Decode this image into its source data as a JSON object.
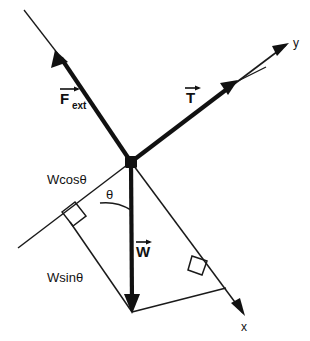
{
  "figure": {
    "background_color": "#ffffff",
    "ink_color": "#111111",
    "width": 310,
    "height": 341
  },
  "origin": {
    "label": "junction-node",
    "x": 131,
    "y": 162
  },
  "axes": [
    {
      "name": "y-axis",
      "label": "y",
      "label_x": 295,
      "label_y": 45,
      "from_x": 131,
      "from_y": 162,
      "to_x": 288,
      "to_y": 43,
      "arrow": "end"
    },
    {
      "name": "x-axis",
      "label": "x",
      "label_x": 245,
      "label_y": 330,
      "from_x": 131,
      "from_y": 162,
      "to_x": 243,
      "to_y": 313,
      "arrow": "end"
    }
  ],
  "vectors": [
    {
      "name": "applied-external-force",
      "symbol": "F",
      "subscript": "ext",
      "label": "F⃗ext",
      "label_x": 62,
      "label_y": 108,
      "tail_x": 131,
      "tail_y": 162,
      "head_x": 56,
      "head_y": 52,
      "weight": "thick"
    },
    {
      "name": "tension-force",
      "symbol": "T",
      "subscript": "",
      "label": "T⃗",
      "label_x": 186,
      "label_y": 106,
      "tail_x": 131,
      "tail_y": 162,
      "head_x": 236,
      "head_y": 82,
      "weight": "thick"
    },
    {
      "name": "weight-force",
      "symbol": "W",
      "subscript": "",
      "label": "W⃗",
      "label_x": 137,
      "label_y": 258,
      "tail_x": 131,
      "tail_y": 162,
      "head_x": 132,
      "head_y": 312,
      "weight": "thick"
    }
  ],
  "components": [
    {
      "name": "weight-component-parallel",
      "label": "Wcosθ",
      "label_x": 48,
      "label_y": 184,
      "from_x": 131,
      "from_y": 162,
      "to_x": 70,
      "to_y": 222
    },
    {
      "name": "weight-component-perpendicular",
      "label": "Wsinθ",
      "label_x": 48,
      "label_y": 282,
      "from_x": 70,
      "from_y": 222,
      "to_x": 132,
      "to_y": 312
    }
  ],
  "angle": {
    "name": "incline-angle",
    "label": "θ",
    "label_x": 109,
    "label_y": 197,
    "vertex_x": 131,
    "vertex_y": 162,
    "radius": 48
  },
  "right_angles": [
    {
      "name": "right-angle-mark-left",
      "cx": 70,
      "cy": 222,
      "size": 14
    },
    {
      "name": "right-angle-mark-right",
      "cx": 199,
      "cy": 266,
      "size": 14
    }
  ],
  "construction_lines": [
    {
      "name": "incline-surface-line",
      "from_x": 131,
      "from_y": 162,
      "to_x": 18,
      "to_y": 248
    },
    {
      "name": "resultant-hypotenuse",
      "from_x": 131,
      "from_y": 162,
      "to_x": 243,
      "to_y": 313
    },
    {
      "name": "base-closure-line",
      "from_x": 132,
      "from_y": 312,
      "to_x": 225,
      "to_y": 288
    },
    {
      "name": "f-ext-extension-line",
      "from_x": 56,
      "from_y": 52,
      "to_x": 24,
      "to_y": 10
    },
    {
      "name": "t-extension-line",
      "from_x": 236,
      "from_y": 82,
      "to_x": 264,
      "to_y": 68
    }
  ]
}
